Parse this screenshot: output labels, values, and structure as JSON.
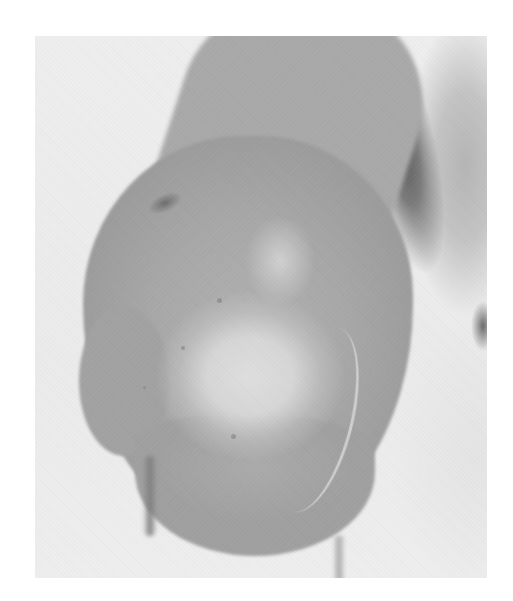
{
  "image": {
    "description": "Grayscale clinical photograph of a rounded elbow/limb region with a pale central patch of skin and a faint curved scar line",
    "colors": {
      "page_background": "#ffffff",
      "photo_background": "#ececec",
      "skin_tone": "#a9a9a9",
      "pale_patch": "#dadada",
      "shadow": "#5a5a5a"
    },
    "frame": {
      "left": 35,
      "top": 36,
      "width": 452,
      "height": 542
    }
  }
}
